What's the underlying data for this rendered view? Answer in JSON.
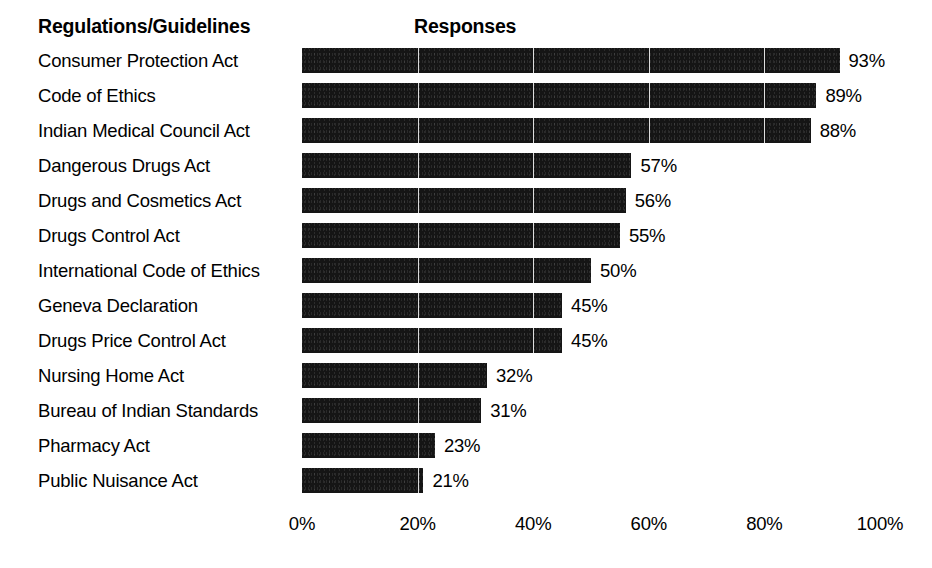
{
  "header": {
    "category_header": "Regulations/Guidelines",
    "value_header": "Responses"
  },
  "chart_data": {
    "type": "bar",
    "orientation": "horizontal",
    "title": "",
    "subtitle": "",
    "xlabel": "Responses",
    "ylabel": "Regulations/Guidelines",
    "xlim": [
      0,
      100
    ],
    "grid": true,
    "legend": "none",
    "value_suffix": "%",
    "bar_color": "#151515",
    "background_color": "#ffffff",
    "tick_labels": [
      "0%",
      "20%",
      "40%",
      "60%",
      "80%",
      "100%"
    ],
    "ticks": [
      0,
      20,
      40,
      60,
      80,
      100
    ],
    "categories": [
      "Consumer Protection Act",
      "Code of Ethics",
      "Indian Medical Council Act",
      "Dangerous Drugs Act",
      "Drugs and Cosmetics Act",
      "Drugs Control Act",
      "International Code of Ethics",
      "Geneva Declaration",
      "Drugs Price Control Act",
      "Nursing Home Act",
      "Bureau of Indian Standards",
      "Pharmacy Act",
      "Public Nuisance Act"
    ],
    "values": [
      93,
      89,
      88,
      57,
      56,
      55,
      50,
      45,
      45,
      32,
      31,
      23,
      21
    ],
    "data_labels": [
      "93%",
      "89%",
      "88%",
      "57%",
      "56%",
      "55%",
      "50%",
      "45%",
      "45%",
      "32%",
      "31%",
      "23%",
      "21%"
    ]
  }
}
